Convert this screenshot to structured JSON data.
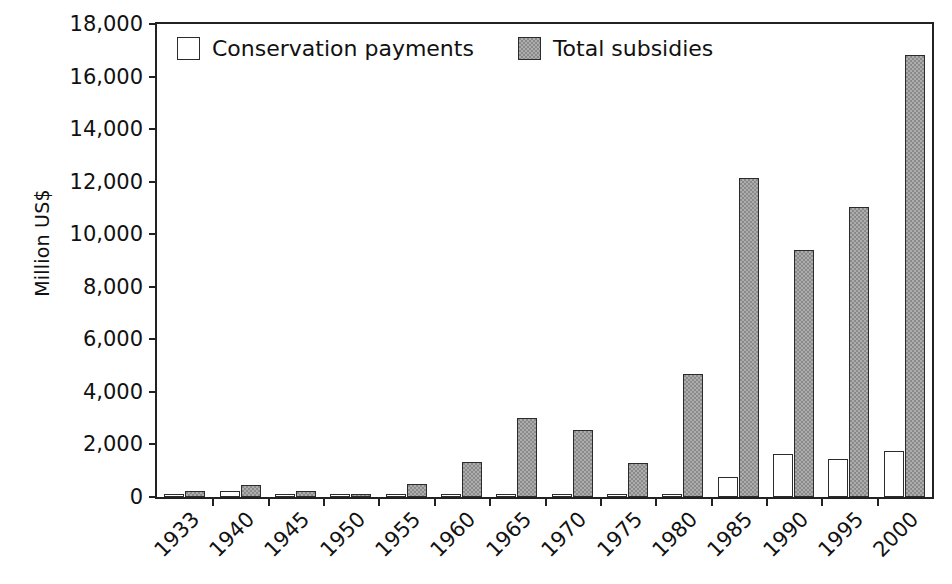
{
  "chart_data": {
    "type": "bar",
    "title": "",
    "subtitle": "",
    "xlabel": "",
    "ylabel": "Million US$",
    "ylim": [
      0,
      18000
    ],
    "ytick_step": 2000,
    "yticks": [
      "0",
      "2,000",
      "4,000",
      "6,000",
      "8,000",
      "10,000",
      "12,000",
      "14,000",
      "16,000",
      "18,000"
    ],
    "grid": false,
    "legend_position": "top-left inside",
    "categories": [
      "1933",
      "1940",
      "1945",
      "1950",
      "1955",
      "1960",
      "1965",
      "1970",
      "1975",
      "1980",
      "1985",
      "1990",
      "1995",
      "2000"
    ],
    "series": [
      {
        "name": "Conservation payments",
        "color": "#ffffff",
        "edge_color": "#2b2b2b",
        "values": [
          50,
          220,
          90,
          40,
          60,
          80,
          90,
          60,
          90,
          70,
          760,
          1620,
          1430,
          1760
        ]
      },
      {
        "name": "Total subsidies",
        "color": "#8a8a8a",
        "edge_color": "#2b2b2b",
        "values": [
          220,
          450,
          230,
          90,
          480,
          1340,
          3020,
          2540,
          1280,
          4680,
          12150,
          9400,
          11020,
          16820
        ]
      }
    ]
  },
  "legend": {
    "items": [
      {
        "label": "Conservation payments",
        "swatch": "white"
      },
      {
        "label": "Total subsidies",
        "swatch": "gray"
      }
    ]
  }
}
